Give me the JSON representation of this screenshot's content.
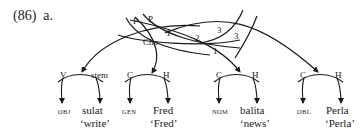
{
  "example": {
    "number": "(86)",
    "sub": "a."
  },
  "upper_labels": {
    "p1": "P",
    "p2": "P",
    "cho": "Cho",
    "n1a": "1",
    "n2": "2",
    "n3a": "3",
    "n3b": "3",
    "n1b": "1"
  },
  "nodes": [
    {
      "left": "V",
      "right": "stem",
      "case": "OBJ",
      "word": "sulat",
      "gloss": "‘write’"
    },
    {
      "left": "C",
      "right": "H",
      "case": "GEN",
      "word": "Fred",
      "gloss": "‘Fred’"
    },
    {
      "left": "C",
      "right": "H",
      "case": "NOM",
      "word": "balita",
      "gloss": "‘news’"
    },
    {
      "left": "C",
      "right": "H",
      "case": "OBL",
      "word": "Perla",
      "gloss": "‘Perla’"
    }
  ]
}
